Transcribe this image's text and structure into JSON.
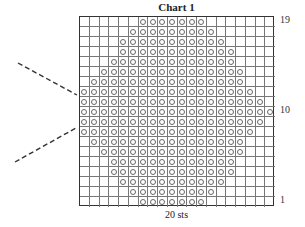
{
  "chart_data": {
    "type": "table",
    "title": "Chart 1",
    "xlabel": "20 sts",
    "columns": 20,
    "rows": 19,
    "row_labels": [
      {
        "label": "19",
        "row": 19
      },
      {
        "label": "10",
        "row": 10
      },
      {
        "label": "1",
        "row": 1
      }
    ],
    "symbol": "circle",
    "pattern_rows_top_to_bottom": [
      {
        "row": 19,
        "start_col": 7,
        "end_col": 13
      },
      {
        "row": 18,
        "start_col": 6,
        "end_col": 14
      },
      {
        "row": 17,
        "start_col": 5,
        "end_col": 15
      },
      {
        "row": 16,
        "start_col": 5,
        "end_col": 16
      },
      {
        "row": 15,
        "start_col": 4,
        "end_col": 16
      },
      {
        "row": 14,
        "start_col": 3,
        "end_col": 17
      },
      {
        "row": 13,
        "start_col": 2,
        "end_col": 17
      },
      {
        "row": 12,
        "start_col": 1,
        "end_col": 18
      },
      {
        "row": 11,
        "start_col": 1,
        "end_col": 19
      },
      {
        "row": 10,
        "start_col": 1,
        "end_col": 20
      },
      {
        "row": 9,
        "start_col": 1,
        "end_col": 19
      },
      {
        "row": 8,
        "start_col": 1,
        "end_col": 18
      },
      {
        "row": 7,
        "start_col": 2,
        "end_col": 17
      },
      {
        "row": 6,
        "start_col": 3,
        "end_col": 17
      },
      {
        "row": 5,
        "start_col": 4,
        "end_col": 16
      },
      {
        "row": 4,
        "start_col": 4,
        "end_col": 16
      },
      {
        "row": 3,
        "start_col": 5,
        "end_col": 15
      },
      {
        "row": 2,
        "start_col": 6,
        "end_col": 14
      },
      {
        "row": 1,
        "start_col": 7,
        "end_col": 13
      }
    ],
    "annotations": [
      "two dashed guide lines converging on left edge between rows 8 and 12"
    ]
  },
  "colors": {
    "grid_line": "#777777",
    "border": "#333333",
    "circle": "#666666",
    "dash": "#333333"
  }
}
